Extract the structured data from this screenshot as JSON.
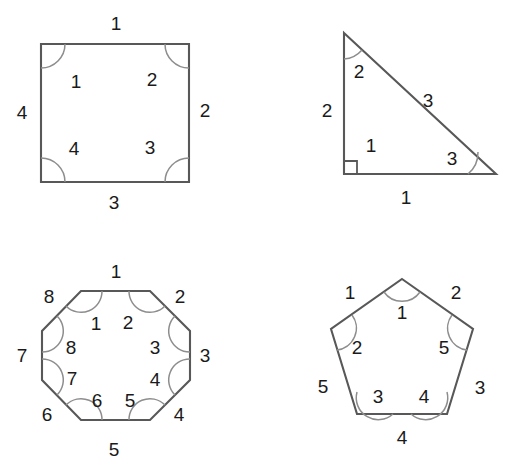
{
  "page": {
    "background_color": "#ffffff",
    "width": 515,
    "height": 464
  },
  "style": {
    "edge_color": "#585858",
    "arc_color": "#8d8d8d",
    "label_color": "#1a1a1a"
  },
  "figures": [
    {
      "name": "square",
      "sides_count": 4,
      "angles_count": 4,
      "side_labels": [
        "1",
        "2",
        "3",
        "4"
      ],
      "angle_labels": [
        "1",
        "2",
        "3",
        "4"
      ],
      "side_label_positions": [
        {
          "text": "1",
          "x": 116,
          "y": 23
        },
        {
          "text": "2",
          "x": 205,
          "y": 110
        },
        {
          "text": "3",
          "x": 114,
          "y": 202
        },
        {
          "text": "4",
          "x": 22,
          "y": 112
        }
      ],
      "angle_label_positions": [
        {
          "text": "1",
          "x": 76,
          "y": 81
        },
        {
          "text": "2",
          "x": 152,
          "y": 79
        },
        {
          "text": "3",
          "x": 150,
          "y": 147
        },
        {
          "text": "4",
          "x": 74,
          "y": 148
        }
      ]
    },
    {
      "name": "right-triangle",
      "sides_count": 3,
      "angles_count": 3,
      "side_labels": [
        "1",
        "2",
        "3"
      ],
      "angle_labels": [
        "1",
        "2",
        "3"
      ],
      "side_label_positions": [
        {
          "text": "1",
          "x": 406,
          "y": 197
        },
        {
          "text": "2",
          "x": 327,
          "y": 110
        },
        {
          "text": "3",
          "x": 428,
          "y": 100
        }
      ],
      "angle_label_positions": [
        {
          "text": "1",
          "x": 371,
          "y": 145
        },
        {
          "text": "2",
          "x": 359,
          "y": 71
        },
        {
          "text": "3",
          "x": 452,
          "y": 158
        }
      ],
      "has_right_angle_mark": true
    },
    {
      "name": "octagon",
      "sides_count": 8,
      "angles_count": 8,
      "side_labels": [
        "1",
        "2",
        "3",
        "4",
        "5",
        "6",
        "7",
        "8"
      ],
      "angle_labels": [
        "1",
        "2",
        "3",
        "4",
        "5",
        "6",
        "7",
        "8"
      ],
      "side_label_positions": [
        {
          "text": "1",
          "x": 116,
          "y": 271
        },
        {
          "text": "2",
          "x": 180,
          "y": 296
        },
        {
          "text": "3",
          "x": 205,
          "y": 355
        },
        {
          "text": "4",
          "x": 179,
          "y": 414
        },
        {
          "text": "5",
          "x": 114,
          "y": 449
        },
        {
          "text": "6",
          "x": 47,
          "y": 414
        },
        {
          "text": "7",
          "x": 22,
          "y": 355
        },
        {
          "text": "8",
          "x": 49,
          "y": 296
        }
      ],
      "angle_label_positions": [
        {
          "text": "1",
          "x": 96,
          "y": 323
        },
        {
          "text": "2",
          "x": 128,
          "y": 322
        },
        {
          "text": "3",
          "x": 155,
          "y": 347
        },
        {
          "text": "4",
          "x": 155,
          "y": 379
        },
        {
          "text": "5",
          "x": 130,
          "y": 400
        },
        {
          "text": "6",
          "x": 97,
          "y": 400
        },
        {
          "text": "7",
          "x": 72,
          "y": 378
        },
        {
          "text": "8",
          "x": 71,
          "y": 347
        }
      ]
    },
    {
      "name": "pentagon",
      "sides_count": 5,
      "angles_count": 5,
      "side_labels": [
        "1",
        "2",
        "3",
        "4",
        "5"
      ],
      "angle_labels": [
        "1",
        "2",
        "3",
        "4",
        "5"
      ],
      "side_label_positions": [
        {
          "text": "1",
          "x": 350,
          "y": 292
        },
        {
          "text": "2",
          "x": 456,
          "y": 292
        },
        {
          "text": "3",
          "x": 480,
          "y": 387
        },
        {
          "text": "4",
          "x": 402,
          "y": 437
        },
        {
          "text": "5",
          "x": 323,
          "y": 386
        }
      ],
      "angle_label_positions": [
        {
          "text": "1",
          "x": 402,
          "y": 312
        },
        {
          "text": "2",
          "x": 357,
          "y": 347
        },
        {
          "text": "3",
          "x": 378,
          "y": 396
        },
        {
          "text": "4",
          "x": 424,
          "y": 396
        },
        {
          "text": "5",
          "x": 444,
          "y": 347
        }
      ]
    }
  ]
}
